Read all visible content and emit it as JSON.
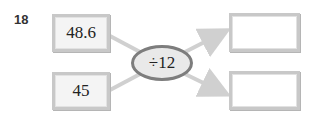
{
  "problem": {
    "number": "18",
    "inputs": [
      "48.6",
      "45"
    ],
    "operation": "÷12",
    "outputs": [
      "",
      ""
    ]
  },
  "colors": {
    "line": "#d0d0d0",
    "box_border": "#c8c8c8",
    "ellipse_border": "#7d7d7d",
    "ellipse_fill": "#e9e9e9"
  }
}
